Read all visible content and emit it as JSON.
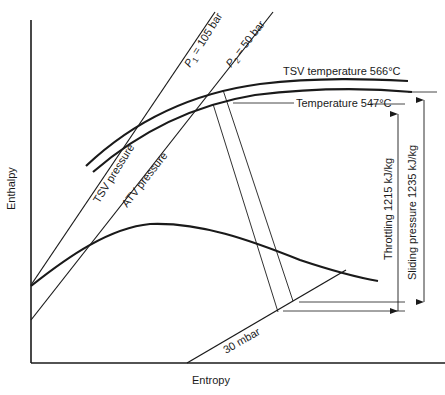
{
  "diagram": {
    "type": "enthalpy-entropy (Mollier) diagram",
    "axes": {
      "x_label": "Entropy",
      "y_label": "Enthalpy"
    },
    "curves": {
      "p1": {
        "label": "P",
        "subscript": "1",
        "suffix": " = 105 bar"
      },
      "p2": {
        "label": "P",
        "subscript": "2",
        "suffix": " = 50 bar"
      },
      "tsv_pressure": {
        "label": "TSV pressure"
      },
      "atv_pressure": {
        "label": "ATV pressure"
      },
      "tsv_temperature": {
        "label": "TSV temperature 566°C"
      },
      "temperature": {
        "label": "Temperature 547°C"
      },
      "condenser": {
        "label": "30 mbar"
      }
    },
    "dimensions": {
      "throttling": {
        "label": "Throttling 1215 kJ/kg"
      },
      "sliding": {
        "label": "Sliding pressure 1235 kJ/kg"
      }
    },
    "colors": {
      "ink": "#1a1a1a",
      "background": "#ffffff"
    }
  }
}
